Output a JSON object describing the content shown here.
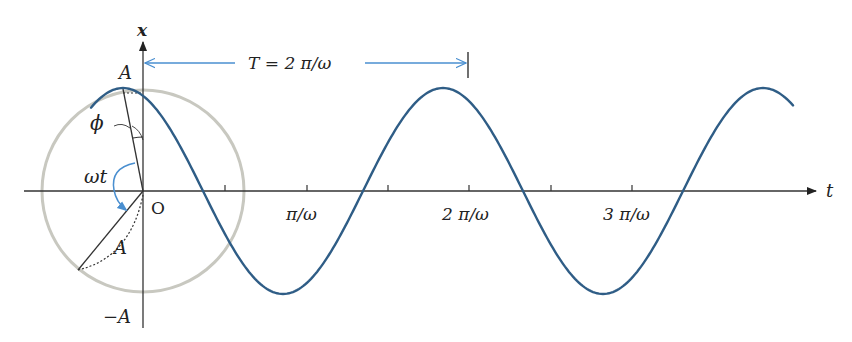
{
  "figure": {
    "colors": {
      "curve": "#2f5d86",
      "axis": "#333333",
      "circle": "#c8c8c0",
      "annotation": "#4a8fd0",
      "background": "#ffffff"
    },
    "labels": {
      "x_axis": "x",
      "t_axis": "t",
      "amplitude_pos": "A",
      "amplitude_neg": "−A",
      "origin": "O",
      "phase": "ϕ",
      "angle": "ωt",
      "radius": "A",
      "period": "T = 2 π/ω"
    },
    "ticks": [
      {
        "label": "",
        "value": "π/2ω"
      },
      {
        "label": "π/ω",
        "value": "π/ω"
      },
      {
        "label": "",
        "value": "3π/2ω"
      },
      {
        "label": "2 π/ω",
        "value": "2π/ω"
      },
      {
        "label": "",
        "value": "5π/2ω"
      },
      {
        "label": "3 π/ω",
        "value": "3π/ω"
      }
    ]
  },
  "chart_data": {
    "type": "line",
    "title": "",
    "xlabel": "t",
    "ylabel": "x",
    "function": "x = A cos(ωt + ϕ)",
    "x_ticks": [
      "π/ω",
      "2 π/ω",
      "3 π/ω"
    ],
    "y_ticks": [
      "A",
      "−A"
    ],
    "annotations": [
      "T = 2 π/ω",
      "ϕ",
      "ωt",
      "O",
      "A"
    ],
    "period": "2π/ω",
    "phase_rad_approx": 0.41,
    "grid": false
  }
}
